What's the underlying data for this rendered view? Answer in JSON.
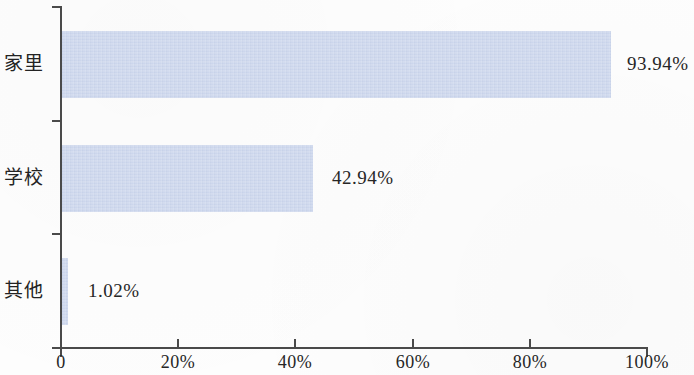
{
  "chart_data": {
    "type": "bar",
    "orientation": "horizontal",
    "title": "",
    "xlabel": "",
    "ylabel": "",
    "categories": [
      "家里",
      "学校",
      "其他"
    ],
    "values": [
      93.94,
      42.94,
      1.02
    ],
    "value_labels": [
      "93.94%",
      "42.94%",
      "1.02%"
    ],
    "xlim": [
      0,
      100
    ],
    "xticks": [
      0,
      20,
      40,
      60,
      80,
      100
    ],
    "xtick_labels": [
      "0",
      "20%",
      "40%",
      "60%",
      "80%",
      "100%"
    ],
    "grid": false,
    "legend": false,
    "bar_color": "#ccd6ec",
    "axis_color": "#4a4a4a",
    "text_color": "#262626",
    "background_color": "#fdfdfd"
  },
  "axis": {
    "ticks": [
      {
        "label": "0",
        "value": 0
      },
      {
        "label": "20%",
        "value": 20
      },
      {
        "label": "40%",
        "value": 40
      },
      {
        "label": "60%",
        "value": 60
      },
      {
        "label": "80%",
        "value": 80
      },
      {
        "label": "100%",
        "value": 100
      }
    ]
  },
  "bars": [
    {
      "category": "家里",
      "value": 93.94,
      "label": "93.94%"
    },
    {
      "category": "学校",
      "value": 42.94,
      "label": "42.94%"
    },
    {
      "category": "其他",
      "value": 1.02,
      "label": "1.02%"
    }
  ]
}
